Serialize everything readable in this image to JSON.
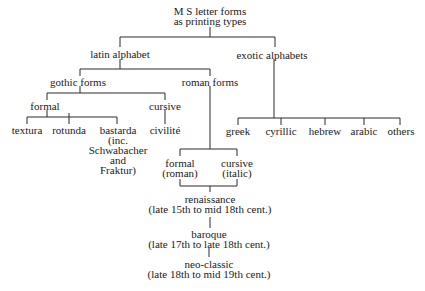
{
  "diagram": {
    "type": "tree",
    "nodes": {
      "root": {
        "lines": [
          "M S  letter forms",
          "as printing types"
        ]
      },
      "latin": {
        "lines": [
          "latin alphabet"
        ]
      },
      "exotic": {
        "lines": [
          "exotic alphabets"
        ]
      },
      "gothic": {
        "lines": [
          "gothic forms"
        ]
      },
      "roman": {
        "lines": [
          "roman forms"
        ]
      },
      "gothic_formal": {
        "lines": [
          "formal"
        ]
      },
      "gothic_cursive": {
        "lines": [
          "cursive"
        ]
      },
      "textura": {
        "lines": [
          "textura"
        ]
      },
      "rotunda": {
        "lines": [
          "rotunda"
        ]
      },
      "bastarda": {
        "lines": [
          "bastarda",
          "(inc.",
          "Schwabacher",
          "and",
          "Fraktur)"
        ]
      },
      "civilite": {
        "lines": [
          "civilité"
        ]
      },
      "greek": {
        "lines": [
          "greek"
        ]
      },
      "cyrillic": {
        "lines": [
          "cyrillic"
        ]
      },
      "hebrew": {
        "lines": [
          "hebrew"
        ]
      },
      "arabic": {
        "lines": [
          "arabic"
        ]
      },
      "others": {
        "lines": [
          "others"
        ]
      },
      "roman_formal": {
        "lines": [
          "formal",
          "(roman)"
        ]
      },
      "roman_cursive": {
        "lines": [
          "cursive",
          "(italic)"
        ]
      },
      "renaissance": {
        "lines": [
          "renaissance",
          "(late 15th to mid  18th cent.)"
        ]
      },
      "baroque": {
        "lines": [
          "baroque",
          "(late 17th to late 18th cent.)"
        ]
      },
      "neoclassic": {
        "lines": [
          "neo-classic",
          "(late 18th to mid  19th cent.)"
        ]
      }
    },
    "edges": [
      [
        "root",
        "latin"
      ],
      [
        "root",
        "exotic"
      ],
      [
        "latin",
        "gothic"
      ],
      [
        "latin",
        "roman"
      ],
      [
        "gothic",
        "gothic_formal"
      ],
      [
        "gothic",
        "gothic_cursive"
      ],
      [
        "gothic_formal",
        "textura"
      ],
      [
        "gothic_formal",
        "rotunda"
      ],
      [
        "gothic_formal",
        "bastarda"
      ],
      [
        "gothic_cursive",
        "civilite"
      ],
      [
        "exotic",
        "greek"
      ],
      [
        "exotic",
        "cyrillic"
      ],
      [
        "exotic",
        "hebrew"
      ],
      [
        "exotic",
        "arabic"
      ],
      [
        "exotic",
        "others"
      ],
      [
        "roman",
        "roman_formal"
      ],
      [
        "roman",
        "roman_cursive"
      ],
      [
        "roman_formal",
        "renaissance"
      ],
      [
        "roman_cursive",
        "renaissance"
      ],
      [
        "renaissance",
        "baroque"
      ],
      [
        "baroque",
        "neoclassic"
      ]
    ]
  }
}
